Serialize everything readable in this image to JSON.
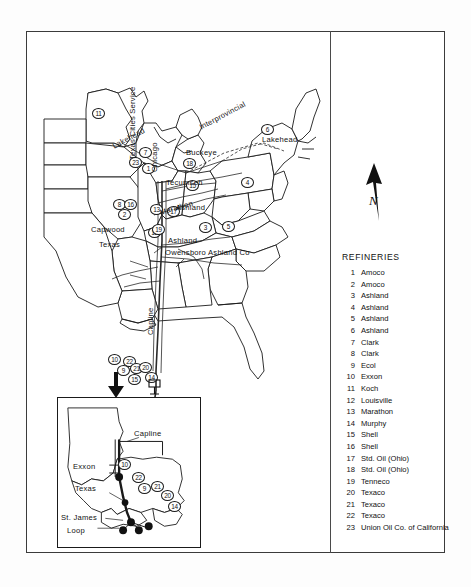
{
  "figure": {
    "type": "map"
  },
  "legend": {
    "title": "REFINERIES",
    "items": [
      {
        "num": "1",
        "name": "Amoco"
      },
      {
        "num": "2",
        "name": "Amoco"
      },
      {
        "num": "3",
        "name": "Ashland"
      },
      {
        "num": "4",
        "name": "Ashland"
      },
      {
        "num": "5",
        "name": "Ashland"
      },
      {
        "num": "6",
        "name": "Ashland"
      },
      {
        "num": "7",
        "name": "Clark"
      },
      {
        "num": "8",
        "name": "Clark"
      },
      {
        "num": "9",
        "name": "Ecol"
      },
      {
        "num": "10",
        "name": "Exxon"
      },
      {
        "num": "11",
        "name": "Koch"
      },
      {
        "num": "12",
        "name": "Louisville"
      },
      {
        "num": "13",
        "name": "Marathon"
      },
      {
        "num": "14",
        "name": "Murphy"
      },
      {
        "num": "15",
        "name": "Shell"
      },
      {
        "num": "16",
        "name": "Shell"
      },
      {
        "num": "17",
        "name": "Std. Oil (Ohio)"
      },
      {
        "num": "18",
        "name": "Std. Oil (Ohio)"
      },
      {
        "num": "19",
        "name": "Tenneco"
      },
      {
        "num": "20",
        "name": "Texaco"
      },
      {
        "num": "21",
        "name": "Texaco"
      },
      {
        "num": "22",
        "name": "Texaco"
      },
      {
        "num": "23",
        "name": "Union Oil Co. of California"
      }
    ]
  },
  "map": {
    "north_label": "N",
    "pipeline_labels": [
      {
        "id": "lakehead-west",
        "text": "Lakehead"
      },
      {
        "id": "interprovincial",
        "text": "Interprovincial"
      },
      {
        "id": "lakehead-east",
        "text": "Lakehead"
      },
      {
        "id": "buckeye",
        "text": "Buckeye"
      },
      {
        "id": "tecumseh",
        "text": "Tecumseh"
      },
      {
        "id": "marathon",
        "text": "Marathon"
      },
      {
        "id": "ashland-ohio",
        "text": "Ashland"
      },
      {
        "id": "ashland-kentucky",
        "text": "Ashland"
      },
      {
        "id": "owensboro",
        "text": "Owensboro Ashland Co"
      },
      {
        "id": "texas-cities-service",
        "text": "Texas Cities Service"
      },
      {
        "id": "chicago",
        "text": "Chicago"
      },
      {
        "id": "capwood",
        "text": "Capwood"
      },
      {
        "id": "texas",
        "text": "Texas"
      },
      {
        "id": "capline",
        "text": "Capline"
      }
    ],
    "markers": [
      {
        "num": "11",
        "x": 92,
        "y": 108
      },
      {
        "num": "6",
        "x": 261,
        "y": 124
      },
      {
        "num": "7",
        "x": 139,
        "y": 147
      },
      {
        "num": "23",
        "x": 129,
        "y": 157
      },
      {
        "num": "1",
        "x": 142,
        "y": 163
      },
      {
        "num": "18",
        "x": 183,
        "y": 158
      },
      {
        "num": "15",
        "x": 186,
        "y": 180
      },
      {
        "num": "4",
        "x": 241,
        "y": 177
      },
      {
        "num": "17",
        "x": 167,
        "y": 206
      },
      {
        "num": "8",
        "x": 113,
        "y": 199
      },
      {
        "num": "16",
        "x": 124,
        "y": 199
      },
      {
        "num": "2",
        "x": 118,
        "y": 209
      },
      {
        "num": "13",
        "x": 150,
        "y": 204
      },
      {
        "num": "3",
        "x": 199,
        "y": 222
      },
      {
        "num": "12",
        "x": 148,
        "y": 227
      },
      {
        "num": "5",
        "x": 222,
        "y": 221
      },
      {
        "num": "19",
        "x": 152,
        "y": 224
      }
    ],
    "gulf_markers": [
      {
        "num": "10",
        "x": 108,
        "y": 354
      },
      {
        "num": "22",
        "x": 123,
        "y": 356
      },
      {
        "num": "9",
        "x": 117,
        "y": 365
      },
      {
        "num": "21",
        "x": 130,
        "y": 363
      },
      {
        "num": "20",
        "x": 139,
        "y": 362
      },
      {
        "num": "14",
        "x": 145,
        "y": 372
      },
      {
        "num": "15",
        "x": 128,
        "y": 374
      }
    ]
  },
  "inset": {
    "labels": [
      {
        "id": "capline",
        "text": "Capline"
      },
      {
        "id": "exxon",
        "text": "Exxon"
      },
      {
        "id": "texas",
        "text": "Texas"
      },
      {
        "id": "st-james",
        "text": "St. James"
      },
      {
        "id": "loop",
        "text": "Loop"
      }
    ],
    "markers": [
      {
        "num": "10",
        "x": 60,
        "y": 61
      },
      {
        "num": "22",
        "x": 74,
        "y": 74
      },
      {
        "num": "9",
        "x": 80,
        "y": 85
      },
      {
        "num": "21",
        "x": 93,
        "y": 83
      },
      {
        "num": "20",
        "x": 103,
        "y": 92
      },
      {
        "num": "14",
        "x": 110,
        "y": 103
      }
    ]
  }
}
